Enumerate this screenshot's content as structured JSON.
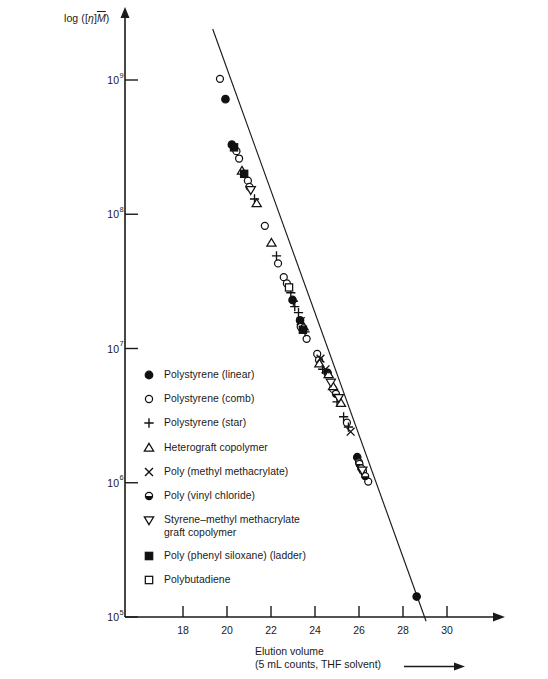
{
  "chart_data": {
    "type": "scatter",
    "title": "",
    "xlabel": "Elution volume",
    "xlabel_sub": "(5 mL counts, THF solvent)",
    "ylabel": "log ([η]M̄)",
    "ylabel_parts": {
      "pre": "log ([",
      "eta": "η",
      "mid": "]",
      "mbar": "M",
      "post": ")"
    },
    "xtick_labels": [
      "18",
      "20",
      "22",
      "24",
      "26",
      "28",
      "30"
    ],
    "xticks": [
      18,
      20,
      22,
      24,
      26,
      28,
      30
    ],
    "xlim": [
      16.4,
      31.4
    ],
    "ytick_labels": [
      "10⁵",
      "10⁶",
      "10⁷",
      "10⁸",
      "10⁹"
    ],
    "ytick_mantissa": [
      "10",
      "10",
      "10",
      "10",
      "10"
    ],
    "ytick_exponents": [
      "5",
      "6",
      "7",
      "8",
      "9"
    ],
    "yticks": [
      100000,
      1000000,
      10000000,
      100000000,
      1000000000
    ],
    "ylim": [
      100000,
      3000000000
    ],
    "grid": false,
    "legend_position": "center-left",
    "axis_color": "#1a1a1a",
    "marker_color": "#111111",
    "series": [
      {
        "name": "Polystyrene (linear)",
        "marker": "filled-circle",
        "points": [
          [
            19.93,
            720000000.0
          ],
          [
            20.22,
            330000000.0
          ],
          [
            22.98,
            23000000.0
          ],
          [
            23.32,
            16200000.0
          ],
          [
            24.57,
            6600000.0
          ],
          [
            25.92,
            1550000.0
          ],
          [
            28.62,
            142000.0
          ]
        ]
      },
      {
        "name": "Polystyrene (comb)",
        "marker": "open-circle",
        "points": [
          [
            19.68,
            1020000000.0
          ],
          [
            20.43,
            295000000.0
          ],
          [
            20.55,
            260000000.0
          ],
          [
            20.95,
            178000000.0
          ],
          [
            21.02,
            160000000.0
          ],
          [
            21.72,
            82000000.0
          ],
          [
            22.32,
            43000000.0
          ],
          [
            22.58,
            34000000.0
          ],
          [
            22.72,
            30500000.0
          ],
          [
            23.35,
            14500000.0
          ],
          [
            23.62,
            11800000.0
          ],
          [
            24.1,
            9100000.0
          ],
          [
            24.18,
            8200000.0
          ],
          [
            24.82,
            5000000.0
          ],
          [
            25.45,
            2800000.0
          ],
          [
            26.0,
            1420000.0
          ],
          [
            26.18,
            1220000.0
          ],
          [
            26.42,
            1020000.0
          ]
        ]
      },
      {
        "name": "Polystyrene (star)",
        "marker": "plus",
        "points": [
          [
            21.25,
            130000000.0
          ],
          [
            22.25,
            49000000.0
          ],
          [
            22.9,
            26000000.0
          ],
          [
            23.02,
            22500000.0
          ],
          [
            23.08,
            20500000.0
          ],
          [
            23.25,
            18500000.0
          ],
          [
            23.55,
            13300000.0
          ],
          [
            24.35,
            7000000.0
          ],
          [
            25.0,
            4000000.0
          ],
          [
            25.3,
            3100000.0
          ],
          [
            25.52,
            2600000.0
          ]
        ]
      },
      {
        "name": "Heterograft copolymer",
        "marker": "open-triangle-up",
        "points": [
          [
            20.68,
            210000000.0
          ],
          [
            21.35,
            120000000.0
          ],
          [
            22.02,
            61000000.0
          ],
          [
            23.48,
            14500000.0
          ],
          [
            24.2,
            7700000.0
          ],
          [
            24.62,
            6400000.0
          ],
          [
            24.82,
            5200000.0
          ],
          [
            25.18,
            3900000.0
          ]
        ]
      },
      {
        "name": "Poly (methyl methacrylate)",
        "marker": "cross",
        "points": [
          [
            23.35,
            16000000.0
          ],
          [
            24.25,
            8400000.0
          ],
          [
            24.48,
            7000000.0
          ],
          [
            25.62,
            2400000.0
          ]
        ]
      },
      {
        "name": "Poly (vinyl chloride)",
        "marker": "half-circle",
        "points": [
          [
            24.95,
            4600000.0
          ],
          [
            26.02,
            1380000.0
          ],
          [
            26.1,
            1280000.0
          ],
          [
            26.28,
            1120000.0
          ]
        ]
      },
      {
        "name": "Styrene–methyl methacrylate\ngraft copolymer",
        "marker": "open-triangle-down",
        "points": [
          [
            21.08,
            152000000.0
          ],
          [
            24.72,
            5600000.0
          ],
          [
            25.08,
            4300000.0
          ],
          [
            26.15,
            1240000.0
          ]
        ]
      },
      {
        "name": "Poly (phenyl siloxane) (ladder)",
        "marker": "filled-square",
        "points": [
          [
            20.32,
            315000000.0
          ],
          [
            20.78,
            200000000.0
          ],
          [
            23.45,
            13800000.0
          ]
        ]
      },
      {
        "name": "Polybutadiene",
        "marker": "open-square",
        "points": [
          [
            22.82,
            28500000.0
          ]
        ]
      }
    ],
    "trend_line": {
      "x_start": 19.35,
      "y_start": 2400000000.0,
      "x_end": 29.05,
      "y_end": 93000.0
    }
  },
  "legend": {
    "items": [
      {
        "label": "Polystyrene (linear)",
        "marker": "filled-circle"
      },
      {
        "label": "Polystyrene (comb)",
        "marker": "open-circle"
      },
      {
        "label": "Polystyrene (star)",
        "marker": "plus"
      },
      {
        "label": "Heterograft copolymer",
        "marker": "open-triangle-up"
      },
      {
        "label": "Poly (methyl methacrylate)",
        "marker": "cross"
      },
      {
        "label": "Poly (vinyl chloride)",
        "marker": "half-circle"
      },
      {
        "label": "Styrene–methyl methacrylate\ngraft copolymer",
        "marker": "open-triangle-down"
      },
      {
        "label": "Poly (phenyl siloxane) (ladder)",
        "marker": "filled-square"
      },
      {
        "label": "Polybutadiene",
        "marker": "open-square"
      }
    ]
  }
}
